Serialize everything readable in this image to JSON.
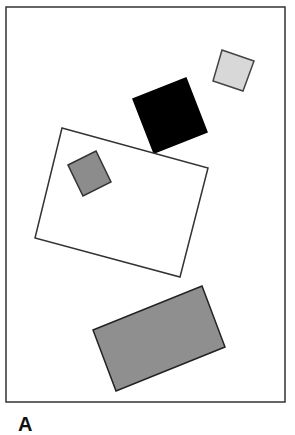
{
  "figure": {
    "label": "A",
    "frame": {
      "x": 6,
      "y": 7,
      "width": 279,
      "height": 395,
      "stroke": "#333333"
    },
    "shapes": [
      {
        "name": "light-gray-square",
        "points": "222,50 254,61 243,91 213,81",
        "fill": "#d8d8d8",
        "stroke": "#444444"
      },
      {
        "name": "black-square",
        "points": "133,99 186,78 207,132 154,153",
        "fill": "#000000",
        "stroke": "#000000"
      },
      {
        "name": "white-rectangle",
        "points": "62,128 208,168 180,277 35,238",
        "fill": "#ffffff",
        "stroke": "#333333"
      },
      {
        "name": "small-gray-square",
        "points": "68,165 96,151 111,182 83,196",
        "fill": "#8c8c8c",
        "stroke": "#333333"
      },
      {
        "name": "large-gray-rectangle",
        "points": "93,330 202,286 225,347 116,391",
        "fill": "#8f8f8f",
        "stroke": "#222222"
      }
    ]
  }
}
